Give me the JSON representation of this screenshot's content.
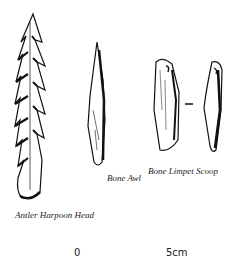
{
  "figure": {
    "artifacts": [
      {
        "name": "Antler Harpoon Head"
      },
      {
        "name": "Bone Awl"
      },
      {
        "name": "Bone Limpet Scoop"
      }
    ],
    "scale": {
      "start": "0",
      "end": "5cm"
    },
    "separator": "–"
  }
}
